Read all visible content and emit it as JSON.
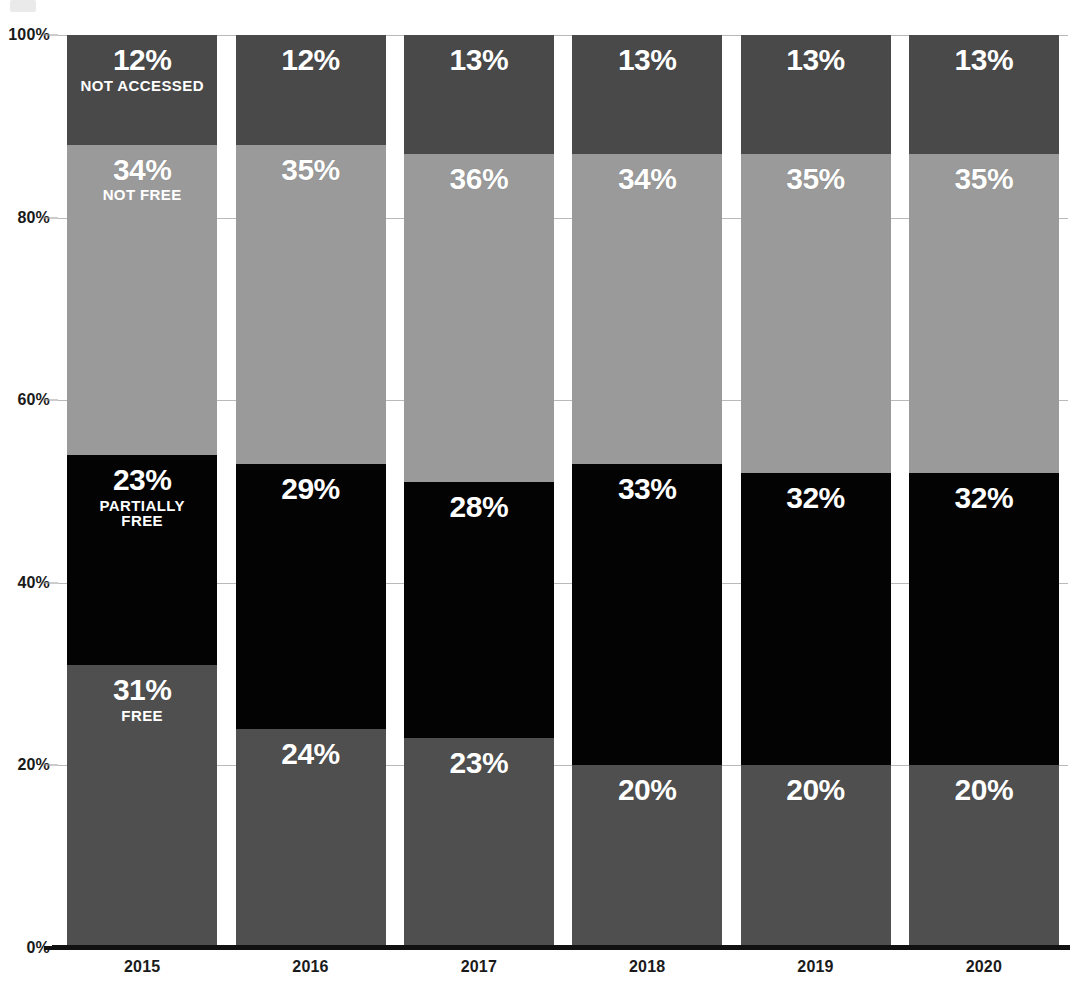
{
  "chart_data": {
    "type": "bar",
    "subtype": "stacked-100-percent",
    "title": "",
    "subtitle": "",
    "xlabel": "",
    "ylabel": "",
    "ylim": [
      0,
      100
    ],
    "yticks": [
      "0%",
      "20%",
      "40%",
      "60%",
      "80%",
      "100%"
    ],
    "ytick_values": [
      0,
      20,
      40,
      60,
      80,
      100
    ],
    "grid": true,
    "legend_position": "in-bar-first-column",
    "categories": [
      "2015",
      "2016",
      "2017",
      "2018",
      "2019",
      "2020"
    ],
    "series": [
      {
        "name": "FREE",
        "key": "free",
        "color": "#4f4f4f",
        "values": [
          31,
          24,
          23,
          20,
          20,
          20
        ],
        "labels": [
          "31%",
          "24%",
          "23%",
          "20%",
          "20%",
          "20%"
        ]
      },
      {
        "name": "PARTIALLY FREE",
        "key": "partially",
        "color": "#030303",
        "values": [
          23,
          29,
          28,
          33,
          32,
          32
        ],
        "labels": [
          "23%",
          "29%",
          "28%",
          "33%",
          "32%",
          "32%"
        ]
      },
      {
        "name": "NOT FREE",
        "key": "notfree",
        "color": "#9a9a9a",
        "values": [
          34,
          35,
          36,
          34,
          35,
          35
        ],
        "labels": [
          "34%",
          "35%",
          "36%",
          "34%",
          "35%",
          "35%"
        ]
      },
      {
        "name": "NOT ACCESSED",
        "key": "notaccessed",
        "color": "#494949",
        "values": [
          12,
          12,
          13,
          13,
          13,
          13
        ],
        "labels": [
          "12%",
          "12%",
          "13%",
          "13%",
          "13%",
          "13%"
        ]
      }
    ],
    "inline_legend_labels": {
      "free": "FREE",
      "partially": "PARTIALLY\nFREE",
      "notfree": "NOT FREE",
      "notaccessed": "NOT ACCESSED"
    },
    "colors": {
      "free": "#4f4f4f",
      "partially": "#030303",
      "notfree": "#9a9a9a",
      "notaccessed": "#494949",
      "gridline": "#b9b9b9",
      "axis": "#111111",
      "text": "#1a1a1a",
      "value_text": "#ffffff",
      "background": "#ffffff"
    }
  }
}
